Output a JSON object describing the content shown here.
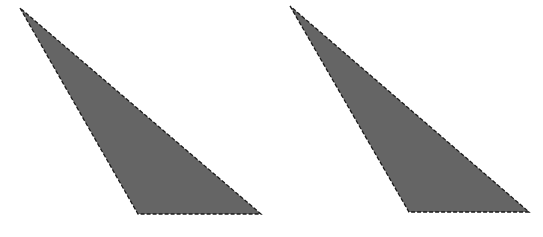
{
  "diagram": {
    "background": "#ffffff",
    "fill_color": "#656565",
    "stroke_color": "#1a1a1a",
    "shapes": [
      {
        "id": "triangle-left",
        "type": "triangle",
        "points": "20,8 138,214 261,214"
      },
      {
        "id": "triangle-right",
        "type": "triangle",
        "points": "290,6 409,212 529,212"
      }
    ]
  }
}
